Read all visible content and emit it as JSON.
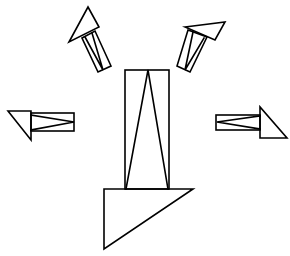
{
  "diagram": {
    "type": "line-drawing",
    "colors": {
      "stroke": "#000000",
      "background": "#ffffff"
    },
    "shapes": [
      {
        "id": "center-arrow",
        "direction": "down",
        "shaft": "rectangle with inscribed V",
        "head": "right-triangle"
      },
      {
        "id": "upper-left-arrow",
        "direction": "up-left",
        "shaft": "rectangle with inscribed V",
        "head": "triangle"
      },
      {
        "id": "upper-right-arrow",
        "direction": "up-right",
        "shaft": "rectangle with inscribed V",
        "head": "triangle"
      },
      {
        "id": "left-arrow",
        "direction": "left",
        "shaft": "rectangle with inscribed V",
        "head": "right-triangle"
      },
      {
        "id": "right-arrow",
        "direction": "right",
        "shaft": "rectangle with inscribed V",
        "head": "right-triangle"
      }
    ]
  }
}
